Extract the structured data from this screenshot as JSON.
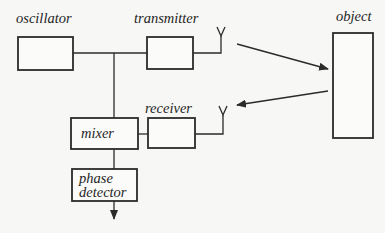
{
  "diagram": {
    "colors": {
      "stroke": "#2b2b2b",
      "text": "#1e1e1e",
      "background": "#f7f7f5"
    },
    "blocks": {
      "oscillator": {
        "label": "oscillator"
      },
      "transmitter": {
        "label": "transmitter"
      },
      "receiver": {
        "label": "receiver"
      },
      "mixer": {
        "label": "mixer"
      },
      "phase_detector": {
        "label_line1": "phase",
        "label_line2": "detector"
      },
      "object": {
        "label": "object"
      }
    },
    "icons": [
      "transmit-antenna-icon",
      "receive-antenna-icon",
      "arrow-to-object",
      "arrow-from-object",
      "output-arrow"
    ]
  }
}
